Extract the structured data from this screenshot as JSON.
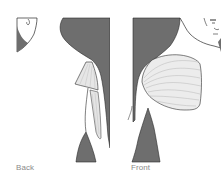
{
  "figure": {
    "panels": [
      {
        "id": "back",
        "label": "Back",
        "highlighted_muscle": "latissimus-teres-region"
      },
      {
        "id": "front",
        "label": "Front",
        "highlighted_muscle": "pectoralis-major"
      }
    ],
    "colors": {
      "body_fill": "#6e6e6e",
      "outline": "#2a2a2a",
      "muscle_light": "#e8e8e8",
      "muscle_shade": "#b5b5b5",
      "label": "#8a8a8a",
      "background": "#ffffff"
    }
  }
}
